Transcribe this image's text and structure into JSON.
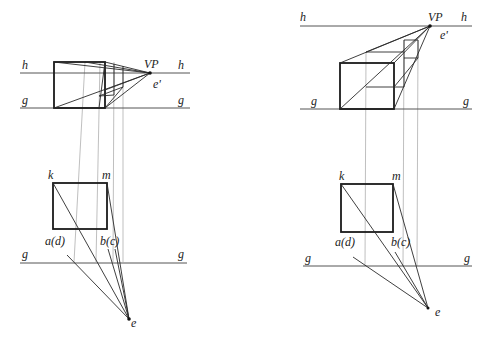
{
  "figures": [
    {
      "id": "left",
      "labels": {
        "horizon_left": "h",
        "horizon_right": "h",
        "vp": "VP",
        "eye_prime": "e'",
        "ground_left": "g",
        "ground_right": "g",
        "plan_ground_left": "g",
        "plan_ground_right": "g",
        "k": "k",
        "m": "m",
        "a_d": "a(d)",
        "b_c": "b(c)",
        "eye": "e"
      }
    },
    {
      "id": "right",
      "labels": {
        "horizon_left": "h",
        "horizon_right": "h",
        "vp": "VP",
        "eye_prime": "e'",
        "ground_left": "g",
        "ground_right": "g",
        "plan_ground_left": "g",
        "plan_ground_right": "g",
        "k": "k",
        "m": "m",
        "a_d": "a(d)",
        "b_c": "b(c)",
        "eye": "e"
      }
    }
  ],
  "colors": {
    "lines": "#1a1a1a",
    "projection_lines": "#b8b8b8",
    "background": "#ffffff"
  }
}
